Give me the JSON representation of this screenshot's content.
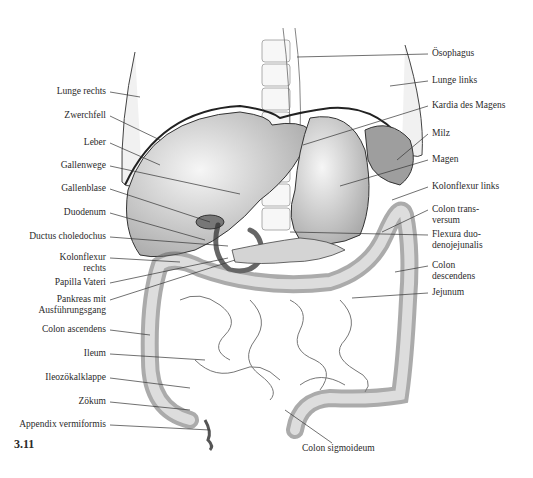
{
  "figure": {
    "number": "3.11",
    "labels_left": [
      {
        "text": "Lunge rechts",
        "x": 110,
        "y": 92,
        "tx": 140,
        "ty": 97
      },
      {
        "text": "Zwerchfell",
        "x": 110,
        "y": 116,
        "tx": 160,
        "ty": 140
      },
      {
        "text": "Leber",
        "x": 110,
        "y": 143,
        "tx": 160,
        "ty": 165
      },
      {
        "text": "Gallenwege",
        "x": 110,
        "y": 166,
        "tx": 240,
        "ty": 194
      },
      {
        "text": "Gallenblase",
        "x": 110,
        "y": 189,
        "tx": 210,
        "ty": 222
      },
      {
        "text": "Duodenum",
        "x": 110,
        "y": 213,
        "tx": 205,
        "ty": 240
      },
      {
        "text": "Ductus choledochus",
        "x": 110,
        "y": 237,
        "tx": 228,
        "ty": 246
      },
      {
        "text": "Kolonflexur\nrechts",
        "x": 110,
        "y": 258,
        "tx": 180,
        "ty": 262
      },
      {
        "text": "Papilla Vateri",
        "x": 110,
        "y": 283,
        "tx": 228,
        "ty": 258
      },
      {
        "text": "Pankreas mit\nAusführungsgang",
        "x": 110,
        "y": 300,
        "tx": 235,
        "ty": 260
      },
      {
        "text": "Colon ascendens",
        "x": 110,
        "y": 330,
        "tx": 150,
        "ty": 335
      },
      {
        "text": "Ileum",
        "x": 110,
        "y": 354,
        "tx": 205,
        "ty": 360
      },
      {
        "text": "Ileozökalklappe",
        "x": 110,
        "y": 378,
        "tx": 190,
        "ty": 388
      },
      {
        "text": "Zökum",
        "x": 110,
        "y": 402,
        "tx": 190,
        "ty": 410
      },
      {
        "text": "Appendix vermiformis",
        "x": 110,
        "y": 425,
        "tx": 210,
        "ty": 430
      }
    ],
    "labels_right": [
      {
        "text": "Ösophagus",
        "x": 428,
        "y": 54,
        "tx": 297,
        "ty": 57
      },
      {
        "text": "Lunge links",
        "x": 428,
        "y": 81,
        "tx": 390,
        "ty": 86
      },
      {
        "text": "Kardia des Magens",
        "x": 428,
        "y": 106,
        "tx": 303,
        "ty": 145
      },
      {
        "text": "Milz",
        "x": 428,
        "y": 134,
        "tx": 397,
        "ty": 160
      },
      {
        "text": "Magen",
        "x": 428,
        "y": 160,
        "tx": 340,
        "ty": 186
      },
      {
        "text": "Kolonflexur links",
        "x": 428,
        "y": 187,
        "tx": 392,
        "ty": 200
      },
      {
        "text": "Colon trans-\nversum",
        "x": 428,
        "y": 210,
        "tx": 382,
        "ty": 232
      },
      {
        "text": "Flexura duo-\ndenojejunalis",
        "x": 428,
        "y": 235,
        "tx": 290,
        "ty": 232
      },
      {
        "text": "Colon\ndescendens",
        "x": 428,
        "y": 266,
        "tx": 395,
        "ty": 272
      },
      {
        "text": "Jejunum",
        "x": 428,
        "y": 293,
        "tx": 352,
        "ty": 298
      },
      {
        "text": "Colon sigmoideum",
        "x": 302,
        "y": 443,
        "tx": 305,
        "ty": 410
      }
    ]
  }
}
